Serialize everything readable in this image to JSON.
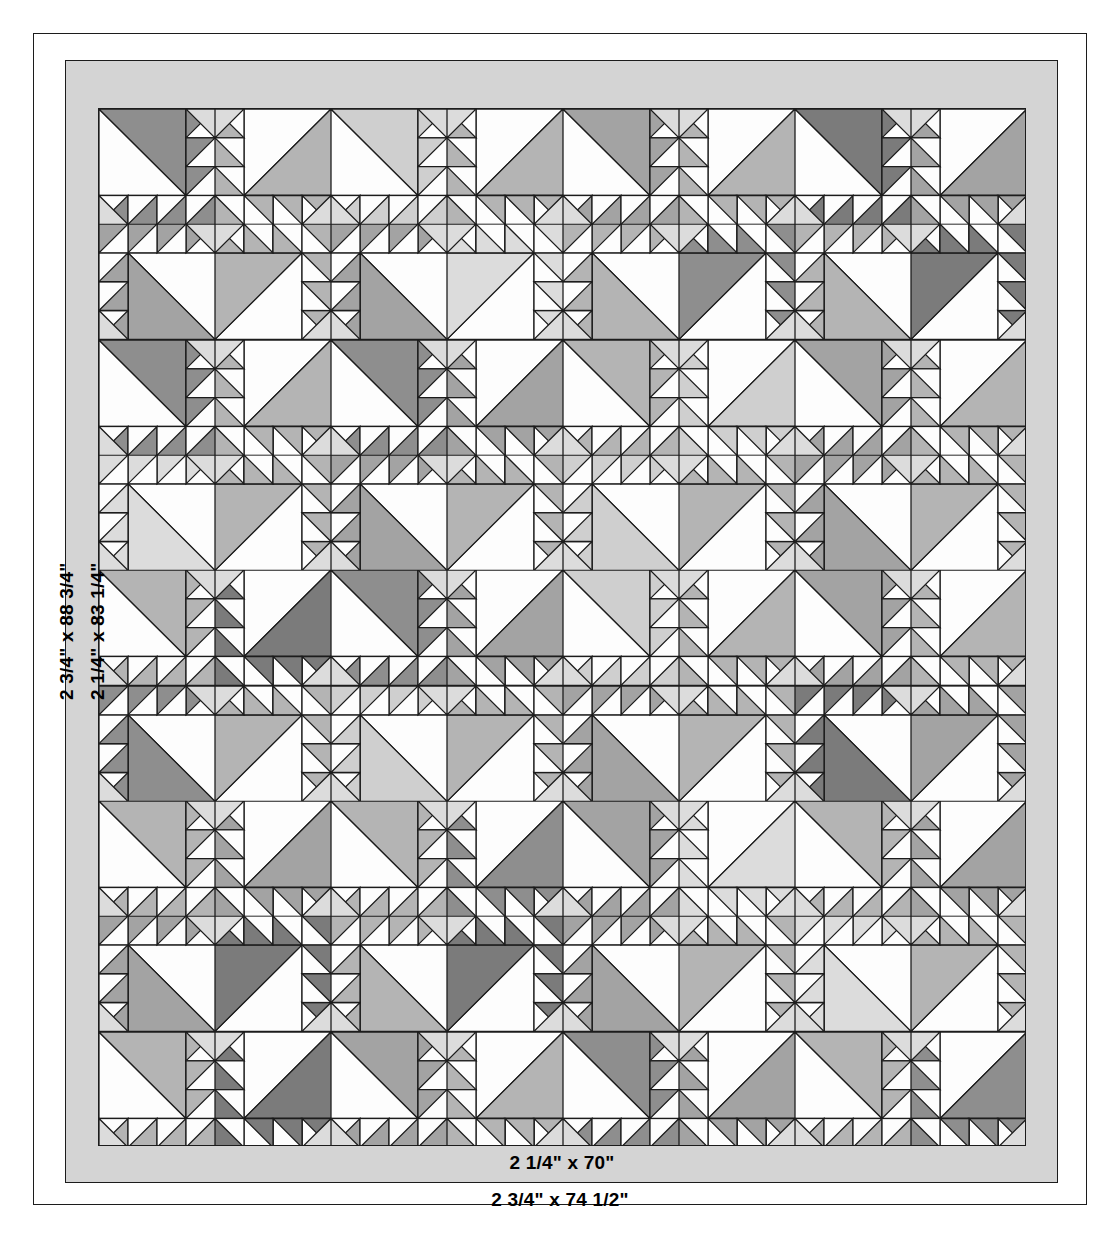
{
  "document": {
    "kind": "quilt-layout-diagram",
    "title_visible": false
  },
  "borders": {
    "inner_border": {
      "label_bottom": "2 1/4\" x 70\"",
      "label_left": "2 1/4\" x 83 1/4\"",
      "color": "#d4d4d4"
    },
    "outer_border": {
      "label_bottom": "2 3/4\" x 74 1/2\"",
      "label_left": "2 3/4\" x 88 3/4\"",
      "color": "#ffffff"
    }
  },
  "palette": {
    "background": "#ffffff",
    "outline": "#1c1c1c",
    "border_gray": "#d4d4d4",
    "fabric_white": "#fdfdfd",
    "fabric_light": "#dcdcdc",
    "fabric_light2": "#cfcfcf",
    "fabric_medium": "#b4b4b4",
    "fabric_medium2": "#a3a3a3",
    "fabric_dark": "#8e8e8e",
    "fabric_darker": "#7b7b7b"
  },
  "grid": {
    "columns": 8,
    "rows": 9,
    "block_name": "tree-sawtooth-block",
    "sawtooth_units": 4,
    "field": {
      "x": 98,
      "y": 108,
      "width": 928,
      "height": 1038
    }
  },
  "blocks": {
    "rotations": [
      [
        0,
        1,
        0,
        1,
        0,
        1,
        0,
        1
      ],
      [
        2,
        3,
        2,
        3,
        2,
        3,
        2,
        3
      ],
      [
        0,
        1,
        0,
        1,
        0,
        1,
        0,
        1
      ],
      [
        2,
        3,
        2,
        3,
        2,
        3,
        2,
        3
      ],
      [
        0,
        1,
        0,
        1,
        0,
        1,
        0,
        1
      ],
      [
        2,
        3,
        2,
        3,
        2,
        3,
        2,
        3
      ],
      [
        0,
        1,
        0,
        1,
        0,
        1,
        0,
        1
      ],
      [
        2,
        3,
        2,
        3,
        2,
        3,
        2,
        3
      ],
      [
        0,
        1,
        0,
        1,
        0,
        1,
        0,
        1
      ]
    ],
    "shades": [
      [
        "#8e8e8e",
        "#b4b4b4",
        "#cfcfcf",
        "#b4b4b4",
        "#a3a3a3",
        "#b4b4b4",
        "#7b7b7b",
        "#a3a3a3"
      ],
      [
        "#a3a3a3",
        "#b4b4b4",
        "#a3a3a3",
        "#dcdcdc",
        "#b4b4b4",
        "#8e8e8e",
        "#b4b4b4",
        "#7b7b7b"
      ],
      [
        "#8e8e8e",
        "#b4b4b4",
        "#8e8e8e",
        "#a3a3a3",
        "#b4b4b4",
        "#cfcfcf",
        "#a3a3a3",
        "#b4b4b4"
      ],
      [
        "#dcdcdc",
        "#b4b4b4",
        "#a3a3a3",
        "#b4b4b4",
        "#cfcfcf",
        "#b4b4b4",
        "#a3a3a3",
        "#b4b4b4"
      ],
      [
        "#b4b4b4",
        "#7b7b7b",
        "#8e8e8e",
        "#a3a3a3",
        "#cfcfcf",
        "#b4b4b4",
        "#a3a3a3",
        "#b4b4b4"
      ],
      [
        "#8e8e8e",
        "#b4b4b4",
        "#cfcfcf",
        "#b4b4b4",
        "#a3a3a3",
        "#b4b4b4",
        "#7b7b7b",
        "#a3a3a3"
      ],
      [
        "#b4b4b4",
        "#a3a3a3",
        "#b4b4b4",
        "#8e8e8e",
        "#a3a3a3",
        "#dcdcdc",
        "#b4b4b4",
        "#a3a3a3"
      ],
      [
        "#a3a3a3",
        "#7b7b7b",
        "#b4b4b4",
        "#7b7b7b",
        "#a3a3a3",
        "#b4b4b4",
        "#dcdcdc",
        "#b4b4b4"
      ],
      [
        "#b4b4b4",
        "#7b7b7b",
        "#a3a3a3",
        "#b4b4b4",
        "#8e8e8e",
        "#a3a3a3",
        "#b4b4b4",
        "#8e8e8e"
      ]
    ]
  }
}
